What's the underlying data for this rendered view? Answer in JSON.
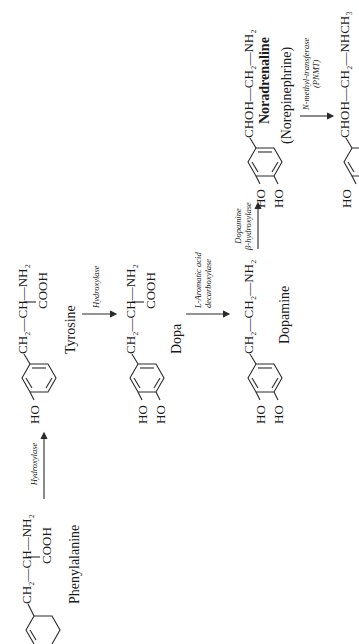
{
  "diagram": {
    "orientation": "rotated 90 degrees counter-clockwise",
    "compounds": [
      {
        "id": "phenylalanine",
        "name": "Phenylalanine",
        "formula_chain": "CH₂—CH—NH₂",
        "substituent": "COOH"
      },
      {
        "id": "tyrosine",
        "name": "Tyrosine",
        "ring_group": "HO",
        "formula_chain": "CH₂—CH—NH₂",
        "substituent": "COOH"
      },
      {
        "id": "dopa",
        "name": "Dopa",
        "ring_groups": [
          "HO",
          "HO"
        ],
        "formula_chain": "CH₂—CH—NH₂",
        "substituent": "COOH"
      },
      {
        "id": "dopamine",
        "name": "Dopamine",
        "ring_groups": [
          "HO",
          "HO"
        ],
        "formula_chain": "CH₂—CH₂—NH₂"
      },
      {
        "id": "noradrenaline",
        "name": "Noradrenaline",
        "alt_name": "(Norepinephrine)",
        "ring_groups": [
          "HO",
          "HO"
        ],
        "formula_chain": "CHOH—CH₂—NH₂"
      },
      {
        "id": "adrenaline",
        "ring_groups": [
          "HO"
        ],
        "formula_chain": "CHOH—CH₂—NHCH₃"
      }
    ],
    "enzymes": [
      {
        "id": "e1",
        "label": "Hydroxylase",
        "from": "phenylalanine",
        "to": "tyrosine"
      },
      {
        "id": "e2",
        "label": "Hydroxylase",
        "from": "tyrosine",
        "to": "dopa"
      },
      {
        "id": "e3",
        "label_line1": "L-Aromatic acid",
        "label_line2": "decarboxylase",
        "from": "dopa",
        "to": "dopamine"
      },
      {
        "id": "e4",
        "label_line1": "Dopamine",
        "label_line2": "β-hydroxylase",
        "from": "dopamine",
        "to": "noradrenaline"
      },
      {
        "id": "e5",
        "label_line1": "N-methyl-transferase",
        "label_line2": "(PNMT)",
        "from": "noradrenaline",
        "to": "adrenaline"
      }
    ]
  },
  "labels": {
    "ho": "HO",
    "cooh": "COOH"
  }
}
